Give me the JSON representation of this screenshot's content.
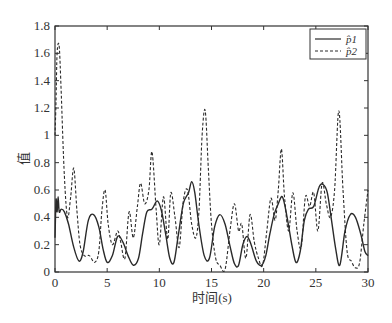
{
  "chart_data": {
    "type": "line",
    "title": "",
    "xlabel": "时间(s)",
    "ylabel": "值",
    "xlim": [
      0,
      30
    ],
    "ylim": [
      0,
      1.8
    ],
    "xticks": [
      0,
      5,
      10,
      15,
      20,
      25,
      30
    ],
    "yticks": [
      0,
      0.2,
      0.4,
      0.6,
      0.8,
      1,
      1.2,
      1.4,
      1.6,
      1.8
    ],
    "ytick_labels": [
      "0",
      "0.2",
      "0.4",
      "0.6",
      "0.8",
      "1",
      "1.2",
      "1.4",
      "1.6",
      "1.8"
    ],
    "grid": false,
    "legend_position": "upper right",
    "series": [
      {
        "name": "p̂1",
        "style": "solid",
        "x": [
          0,
          0.1,
          0.2,
          0.3,
          0.4,
          0.6,
          0.9,
          1.3,
          1.8,
          2.3,
          2.7,
          3.2,
          3.7,
          4.2,
          4.6,
          5.0,
          5.5,
          6.0,
          6.5,
          7.0,
          7.5,
          8.0,
          8.4,
          8.8,
          9.3,
          9.8,
          10.2,
          10.6,
          11.0,
          11.4,
          11.8,
          12.3,
          12.8,
          13.1,
          13.4,
          13.8,
          14.3,
          14.8,
          15.3,
          15.8,
          16.3,
          16.8,
          17.2,
          17.6,
          18.0,
          18.4,
          18.8,
          19.3,
          19.8,
          20.2,
          20.6,
          21.0,
          21.4,
          21.8,
          22.2,
          22.7,
          23.1,
          23.5,
          23.9,
          24.3,
          24.8,
          25.3,
          25.7,
          26.1,
          26.5,
          26.9,
          27.3,
          27.8,
          28.3,
          28.8,
          29.3,
          29.7,
          30.0
        ],
        "y": [
          0.25,
          0.53,
          0.44,
          0.55,
          0.44,
          0.46,
          0.44,
          0.35,
          0.18,
          0.08,
          0.15,
          0.38,
          0.42,
          0.33,
          0.17,
          0.07,
          0.12,
          0.26,
          0.22,
          0.12,
          0.05,
          0.1,
          0.28,
          0.44,
          0.46,
          0.52,
          0.45,
          0.28,
          0.1,
          0.07,
          0.26,
          0.5,
          0.58,
          0.66,
          0.58,
          0.34,
          0.12,
          0.1,
          0.33,
          0.42,
          0.35,
          0.18,
          0.06,
          0.05,
          0.2,
          0.26,
          0.2,
          0.08,
          0.05,
          0.12,
          0.28,
          0.42,
          0.5,
          0.55,
          0.42,
          0.2,
          0.07,
          0.15,
          0.38,
          0.46,
          0.48,
          0.62,
          0.64,
          0.58,
          0.38,
          0.17,
          0.05,
          0.3,
          0.42,
          0.4,
          0.28,
          0.15,
          0.12
        ]
      },
      {
        "name": "p̂2",
        "style": "dashed",
        "x": [
          0,
          0.1,
          0.2,
          0.4,
          0.6,
          0.9,
          1.2,
          1.5,
          1.8,
          2.1,
          2.4,
          2.8,
          3.3,
          3.8,
          4.2,
          4.5,
          4.8,
          5.1,
          5.5,
          6.0,
          6.3,
          6.7,
          7.1,
          7.5,
          7.9,
          8.2,
          8.6,
          9.0,
          9.3,
          9.7,
          10.0,
          10.4,
          10.8,
          11.1,
          11.5,
          11.9,
          12.3,
          12.7,
          13.1,
          13.5,
          13.8,
          14.1,
          14.4,
          14.7,
          15.0,
          15.4,
          15.8,
          16.3,
          16.8,
          17.2,
          17.6,
          17.9,
          18.3,
          18.7,
          19.1,
          19.5,
          19.9,
          20.3,
          20.7,
          21.1,
          21.4,
          21.7,
          22.0,
          22.4,
          22.8,
          23.2,
          23.6,
          24.0,
          24.4,
          24.8,
          25.2,
          25.6,
          26.0,
          26.4,
          26.8,
          27.2,
          27.6,
          28.0,
          28.4,
          28.8,
          29.2,
          29.6,
          30.0
        ],
        "y": [
          1.0,
          1.25,
          1.6,
          1.65,
          1.3,
          0.7,
          0.4,
          0.55,
          0.76,
          0.45,
          0.2,
          0.12,
          0.12,
          0.07,
          0.15,
          0.45,
          0.6,
          0.35,
          0.2,
          0.3,
          0.22,
          0.1,
          0.44,
          0.25,
          0.48,
          0.65,
          0.5,
          0.6,
          0.88,
          0.45,
          0.2,
          0.55,
          0.24,
          0.58,
          0.4,
          0.18,
          0.52,
          0.6,
          0.35,
          0.25,
          0.45,
          1.0,
          1.18,
          0.75,
          0.35,
          0.1,
          0.05,
          0.02,
          0.32,
          0.5,
          0.3,
          0.35,
          0.1,
          0.42,
          0.22,
          0.1,
          0.05,
          0.3,
          0.54,
          0.38,
          0.6,
          0.9,
          0.55,
          0.3,
          0.58,
          0.3,
          0.18,
          0.55,
          0.48,
          0.58,
          0.3,
          0.65,
          0.5,
          0.4,
          0.6,
          1.18,
          0.6,
          0.15,
          0.08,
          0.03,
          0.07,
          0.35,
          0.6
        ]
      }
    ]
  },
  "legend": {
    "items": [
      {
        "label": "p̂1",
        "style": "solid"
      },
      {
        "label": "p̂2",
        "style": "dashed"
      }
    ]
  },
  "axes": {
    "xlabel": "时间(s)",
    "ylabel": "值"
  }
}
